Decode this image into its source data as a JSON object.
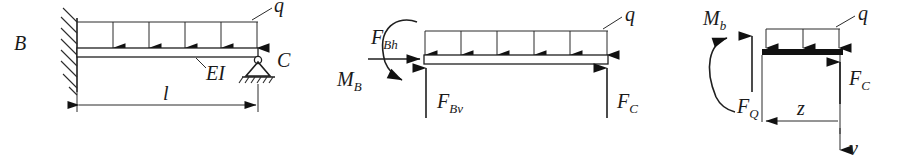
{
  "figure": {
    "background_color": "#ffffff",
    "ink_color": "#1a1a1a",
    "width": 915,
    "height": 167
  },
  "diagram_1": {
    "name": "supported-cantilever-beam",
    "labels": {
      "support_left": "B",
      "support_right": "C",
      "distributed_load": "q",
      "stiffness": "EI",
      "span": "l"
    },
    "load_arrow_count": 5,
    "left_support_type": "fixed-wall-hatched",
    "right_support_type": "pin-roller-hatched-ground",
    "beam_style": "hollow-rectangle"
  },
  "diagram_2": {
    "name": "free-body-reactions",
    "labels": {
      "moment": "M_B",
      "moment_display": "M",
      "moment_sub": "B",
      "horizontal_force": "F_Bh",
      "horizontal_force_display": "F",
      "horizontal_force_sub": "Bh",
      "vertical_force_left": "F_Bv",
      "vertical_force_left_display": "F",
      "vertical_force_left_sub": "Bv",
      "vertical_force_right": "F_C",
      "vertical_force_right_display": "F",
      "vertical_force_right_sub": "C",
      "distributed_load": "q"
    },
    "load_arrow_count": 6,
    "moment_direction": "counterclockwise",
    "beam_style": "hollow-rectangle"
  },
  "diagram_3": {
    "name": "cut-section-internal-forces",
    "labels": {
      "bending_moment": "M_b",
      "bending_moment_display": "M",
      "bending_moment_sub": "b",
      "shear_force": "F_Q",
      "shear_force_display": "F",
      "shear_force_sub": "Q",
      "support_force": "F_C",
      "support_force_display": "F",
      "support_force_sub": "C",
      "distributed_load": "q",
      "coordinate": "z",
      "deflection": "v"
    },
    "load_arrow_count": 3,
    "moment_direction": "clockwise",
    "beam_style": "solid-thick"
  }
}
